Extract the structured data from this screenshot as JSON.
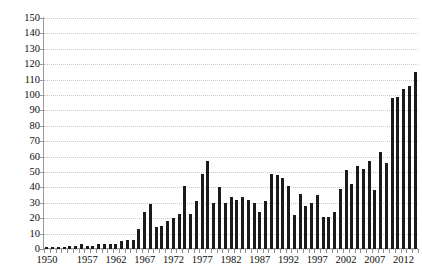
{
  "chart_data": {
    "type": "bar",
    "title": "",
    "subtitle": "",
    "xlabel": "",
    "ylabel": "",
    "ylim": [
      0,
      150
    ],
    "ytick_step": 10,
    "yticks": [
      0,
      10,
      20,
      30,
      40,
      50,
      60,
      70,
      80,
      90,
      100,
      110,
      120,
      130,
      140,
      150
    ],
    "grid": true,
    "legend": false,
    "bar_color": "#1a1a1a",
    "grid_color": "#c9c9c9",
    "axis_color": "#9a9a9a",
    "categories": [
      "1950",
      "1951",
      "1952",
      "1953",
      "1954",
      "1955",
      "1956",
      "1957",
      "1958",
      "1959",
      "1960",
      "1961",
      "1962",
      "1963",
      "1964",
      "1965",
      "1966",
      "1967",
      "1968",
      "1969",
      "1970",
      "1971",
      "1972",
      "1973",
      "1974",
      "1975",
      "1976",
      "1977",
      "1978",
      "1979",
      "1980",
      "1981",
      "1982",
      "1983",
      "1984",
      "1985",
      "1986",
      "1987",
      "1988",
      "1989",
      "1990",
      "1991",
      "1992",
      "1993",
      "1994",
      "1995",
      "1996",
      "1997",
      "1998",
      "1999",
      "2000",
      "2001",
      "2002",
      "2003",
      "2004",
      "2005",
      "2006",
      "2007",
      "2008",
      "2009",
      "2010",
      "2011",
      "2012",
      "2013",
      "2014"
    ],
    "values": [
      1,
      1,
      1,
      1,
      2,
      2,
      3,
      2,
      2,
      3,
      3,
      3,
      3,
      5,
      6,
      6,
      13,
      24,
      29,
      14,
      15,
      18,
      20,
      23,
      41,
      23,
      31,
      49,
      57,
      30,
      40,
      30,
      34,
      32,
      34,
      32,
      30,
      24,
      31,
      49,
      48,
      46,
      41,
      22,
      36,
      28,
      30,
      35,
      21,
      21,
      24,
      39,
      51,
      42,
      54,
      52,
      57,
      38,
      63,
      56,
      98,
      99,
      104,
      106,
      115
    ],
    "xtick_labels": [
      "1950",
      "1957",
      "1962",
      "1967",
      "1972",
      "1977",
      "1982",
      "1987",
      "1992",
      "1997",
      "2002",
      "2007",
      "2012"
    ],
    "xtick_label_indices": [
      0,
      7,
      12,
      17,
      22,
      27,
      32,
      37,
      42,
      47,
      52,
      57,
      62
    ],
    "extra_values_note": ""
  }
}
